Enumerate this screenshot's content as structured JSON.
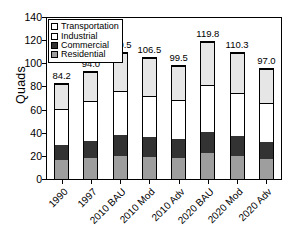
{
  "chart_data": {
    "type": "bar",
    "title": "",
    "xlabel": "",
    "ylabel": "Quads",
    "ylim": [
      0,
      140
    ],
    "ytick_labels": [
      "140",
      "120",
      "100",
      "80",
      "60",
      "40",
      "20",
      "0"
    ],
    "ytick_values": [
      140,
      120,
      100,
      80,
      60,
      40,
      20,
      0
    ],
    "grid": false,
    "stacked": true,
    "legend_position": "top-left-inside",
    "categories": [
      "1990",
      "1997",
      "2010 BAU",
      "2010 Mod",
      "2010 Adv",
      "2020 BAU",
      "2020 Mod",
      "2020 Adv"
    ],
    "series": [
      {
        "name": "Residential",
        "values": [
          16.6,
          18.9,
          20.5,
          19.3,
          18.7,
          22.5,
          20.2,
          17.5
        ]
      },
      {
        "name": "Commercial",
        "values": [
          13.2,
          14.6,
          18.0,
          17.4,
          16.5,
          19.0,
          17.6,
          15.3
        ]
      },
      {
        "name": "Industrial",
        "values": [
          31.8,
          35.0,
          39.0,
          36.6,
          34.3,
          41.0,
          38.0,
          34.0
        ]
      },
      {
        "name": "Transportation",
        "values": [
          22.6,
          25.5,
          33.0,
          33.2,
          30.0,
          37.3,
          34.5,
          30.2
        ]
      }
    ],
    "totals": [
      84.2,
      94.0,
      110.5,
      106.5,
      99.5,
      119.8,
      110.3,
      97.0
    ],
    "total_labels": [
      "84.2",
      "94.0",
      "110.5",
      "106.5",
      "99.5",
      "119.8",
      "110.3",
      "97.0"
    ],
    "colors": {
      "Transportation": "#e6e6e6",
      "Industrial": "#ffffff",
      "Commercial": "#333333",
      "Residential": "#9e9e9e",
      "axis": "#000000",
      "background": "#ffffff"
    }
  },
  "legend": {
    "items": [
      {
        "label": "Transportation",
        "key": "transportation"
      },
      {
        "label": "Industrial",
        "key": "industrial"
      },
      {
        "label": "Commercial",
        "key": "commercial"
      },
      {
        "label": "Residential",
        "key": "residential"
      }
    ]
  },
  "caption": {
    "text": ""
  }
}
